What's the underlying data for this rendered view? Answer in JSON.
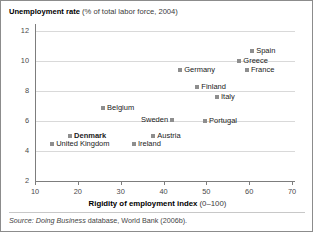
{
  "title": {
    "main": "Unemployment rate",
    "sub": "(% of total labor force, 2004)"
  },
  "axis_titles": {
    "x_main": "Rigidity of employment index",
    "x_sub": "(0–100)"
  },
  "source": {
    "prefix": "Source:",
    "italic_part": "Doing Business",
    "rest": "database, World Bank (2006b)."
  },
  "chart_data": {
    "type": "scatter",
    "title": "Unemployment rate (% of total labor force, 2004)",
    "xlabel": "Rigidity of employment index (0–100)",
    "ylabel": "Unemployment rate (% of total labor force, 2004)",
    "xlim": [
      5,
      74
    ],
    "ylim": [
      2,
      12.6
    ],
    "xticks": [
      10,
      20,
      30,
      40,
      50,
      60,
      70
    ],
    "yticks": [
      2,
      4,
      6,
      8,
      10,
      12
    ],
    "grid": "horizontal",
    "legend": "none",
    "marker_color": "#8e8e8e",
    "points": [
      {
        "label": "Spain",
        "x": 60.7,
        "y": 10.7,
        "label_pos": "right",
        "bold": false
      },
      {
        "label": "Greece",
        "x": 57.7,
        "y": 10.0,
        "label_pos": "right",
        "bold": false
      },
      {
        "label": "France",
        "x": 59.5,
        "y": 9.4,
        "label_pos": "right",
        "bold": false
      },
      {
        "label": "Germany",
        "x": 43.9,
        "y": 9.4,
        "label_pos": "right",
        "bold": false
      },
      {
        "label": "Finland",
        "x": 47.9,
        "y": 8.3,
        "label_pos": "right",
        "bold": false
      },
      {
        "label": "Italy",
        "x": 52.5,
        "y": 7.6,
        "label_pos": "right",
        "bold": false
      },
      {
        "label": "Belgium",
        "x": 25.9,
        "y": 6.9,
        "label_pos": "right",
        "bold": false
      },
      {
        "label": "Sweden",
        "x": 42.0,
        "y": 6.1,
        "label_pos": "left",
        "bold": false
      },
      {
        "label": "Portugal",
        "x": 49.7,
        "y": 6.0,
        "label_pos": "right",
        "bold": false
      },
      {
        "label": "Denmark",
        "x": 18.2,
        "y": 5.0,
        "label_pos": "right",
        "bold": true
      },
      {
        "label": "Austria",
        "x": 37.6,
        "y": 5.0,
        "label_pos": "right",
        "bold": false
      },
      {
        "label": "United Kingdom",
        "x": 14.0,
        "y": 4.5,
        "label_pos": "right",
        "bold": false
      },
      {
        "label": "Ireland",
        "x": 33.1,
        "y": 4.5,
        "label_pos": "right",
        "bold": false
      }
    ]
  }
}
